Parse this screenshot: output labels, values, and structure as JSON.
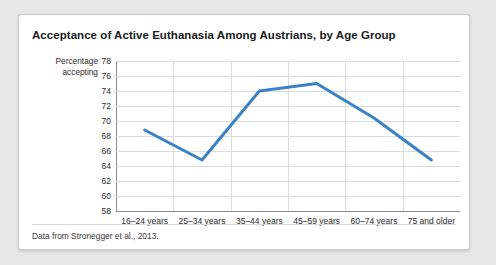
{
  "card": {
    "title": "Acceptance of Active Euthanasia Among Austrians, by Age Group",
    "caption": "Data from Stronegger et al., 2013.",
    "accent_color": "#3b82c4",
    "background_color": "#ffffff",
    "page_background_color": "#e8e8e6",
    "gridline_color": "#dcdcdc",
    "axis_color": "#8c8c8c"
  },
  "chart_data": {
    "type": "line",
    "title": "Acceptance of Active Euthanasia Among Austrians, by Age Group",
    "xlabel": "",
    "ylabel": "Percentage accepting",
    "categories": [
      "16–24 years",
      "25–34 years",
      "35–44 years",
      "45–59 years",
      "60–74 years",
      "75 and older"
    ],
    "values": [
      68.8,
      64.8,
      74.0,
      75.0,
      70.4,
      64.8
    ],
    "series": [
      {
        "name": "Percentage accepting",
        "color": "#3b82c4",
        "values": [
          68.8,
          64.8,
          74.0,
          75.0,
          70.4,
          64.8
        ]
      }
    ],
    "ylim": [
      58,
      78
    ],
    "ytick_step": 2,
    "yticks": [
      58,
      60,
      62,
      64,
      66,
      68,
      70,
      72,
      74,
      76,
      78
    ],
    "grid": true,
    "grid_axis": "both",
    "legend": false,
    "markers": false,
    "line_width": 3
  }
}
